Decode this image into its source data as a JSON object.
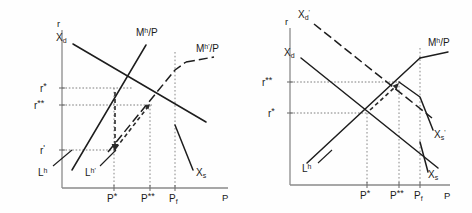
{
  "figure": {
    "title": "",
    "panels": [
      {
        "id": "left",
        "axis": {
          "y_label": "r",
          "x_label": "P"
        },
        "y_ticks": [
          {
            "label": "r*",
            "y": 88
          },
          {
            "label": "r**",
            "y": 105
          },
          {
            "label": "r'",
            "y": 150
          }
        ],
        "x_ticks": [
          {
            "label": "P*",
            "x": 114
          },
          {
            "label": "P**",
            "x": 150
          },
          {
            "label": "Pf",
            "x": 175
          }
        ],
        "curves": [
          {
            "name": "Xd",
            "label": "Xd",
            "style": "solid"
          },
          {
            "name": "Mh_P",
            "label": "Mh/P",
            "style": "solid"
          },
          {
            "name": "Mhp_P",
            "label": "Mh'/P",
            "style": "dashed"
          },
          {
            "name": "Lh",
            "label": "Lh",
            "style": "solid"
          },
          {
            "name": "Lhp",
            "label": "Lh'",
            "style": "solid"
          },
          {
            "name": "Xs",
            "label": "Xs",
            "style": "solid"
          }
        ],
        "annotations": [
          {
            "name": "adjustment-arrow-down",
            "desc": "r* down to r' at P*"
          },
          {
            "name": "adjustment-arrow-diagonal",
            "desc": "r' up to r** toward P**"
          }
        ]
      },
      {
        "id": "right",
        "axis": {
          "y_label": "r",
          "x_label": "P"
        },
        "y_ticks": [
          {
            "label": "r**",
            "y": 82
          },
          {
            "label": "r*",
            "y": 113
          }
        ],
        "x_ticks": [
          {
            "label": "P*",
            "x": 131
          },
          {
            "label": "P**",
            "x": 163
          },
          {
            "label": "Pf",
            "x": 184
          }
        ],
        "curves": [
          {
            "name": "Xd",
            "label": "Xd",
            "style": "solid"
          },
          {
            "name": "Xdp",
            "label": "Xd'",
            "style": "dashed"
          },
          {
            "name": "Mh_P",
            "label": "Mh/P",
            "style": "solid"
          },
          {
            "name": "Lh",
            "label": "Lh",
            "style": "solid"
          },
          {
            "name": "Xs",
            "label": "Xs",
            "style": "solid"
          },
          {
            "name": "Xsp",
            "label": "Xs'",
            "style": "solid"
          }
        ],
        "annotations": [
          {
            "name": "adjustment-arrow-diagonal",
            "desc": "r* up to r** toward P**"
          }
        ]
      }
    ]
  },
  "labels": {
    "r": "r",
    "P": "P",
    "r_star": "r",
    "r_starstar": "r",
    "r_prime": "r",
    "star": "*",
    "starstar": "**",
    "prime": "'",
    "P_star": "P",
    "P_starstar": "P",
    "P_f": "P",
    "f": "f",
    "X": "X",
    "d": "d",
    "s": "s",
    "M": "M",
    "h": "h",
    "slashP": "/P",
    "L": "L"
  },
  "colors": {
    "axis": "#8a8a8a",
    "curve": "#1d1d1d",
    "guide": "#6f6f6f",
    "background": "#fefefe"
  }
}
